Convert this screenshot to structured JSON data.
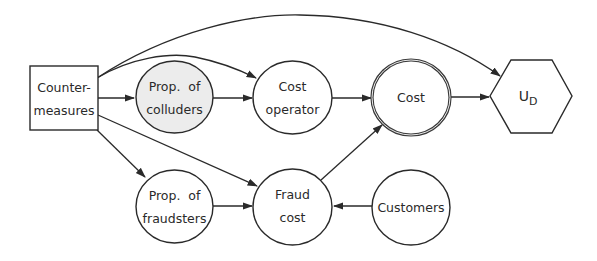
{
  "diagram": {
    "type": "influence-diagram",
    "nodes": {
      "countermeasures": {
        "line1": "Counter-",
        "line2": "measures",
        "shape": "decision-rectangle"
      },
      "colluders": {
        "line1": "Prop.  of",
        "line2": "colluders",
        "shape": "chance-circle-shaded"
      },
      "fraudsters": {
        "line1": "Prop.  of",
        "line2": "fraudsters",
        "shape": "chance-circle"
      },
      "cost_operator": {
        "line1": "Cost",
        "line2": "operator",
        "shape": "chance-circle"
      },
      "fraud_cost": {
        "line1": "Fraud",
        "line2": "cost",
        "shape": "chance-circle"
      },
      "cost": {
        "label": "Cost",
        "shape": "deterministic-double-circle"
      },
      "customers": {
        "label": "Customers",
        "shape": "chance-circle"
      },
      "utility": {
        "label": "U",
        "subscript": "D",
        "shape": "utility-hexagon"
      }
    },
    "edges": [
      {
        "from": "Counter-measures",
        "to": "Prop. of colluders"
      },
      {
        "from": "Counter-measures",
        "to": "Cost operator"
      },
      {
        "from": "Counter-measures",
        "to": "UD"
      },
      {
        "from": "Counter-measures",
        "to": "Prop. of fraudsters"
      },
      {
        "from": "Counter-measures",
        "to": "Fraud cost"
      },
      {
        "from": "Prop. of colluders",
        "to": "Cost operator"
      },
      {
        "from": "Prop. of fraudsters",
        "to": "Fraud cost"
      },
      {
        "from": "Cost operator",
        "to": "Cost"
      },
      {
        "from": "Fraud cost",
        "to": "Cost"
      },
      {
        "from": "Customers",
        "to": "Fraud cost"
      },
      {
        "from": "Cost",
        "to": "UD"
      }
    ],
    "colors": {
      "stroke": "#2a2a2a",
      "shaded_fill": "#ececec",
      "background": "#ffffff"
    }
  }
}
